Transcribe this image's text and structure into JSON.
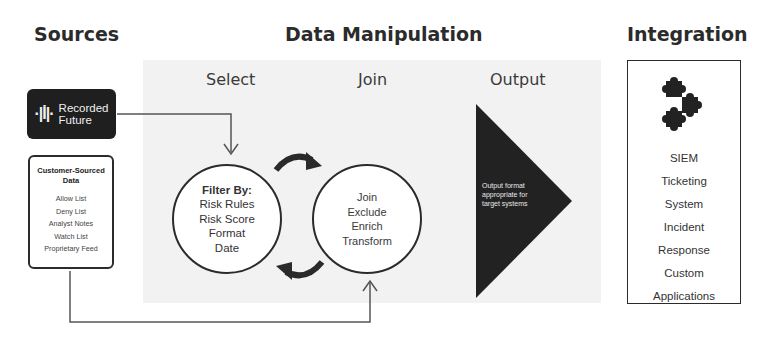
{
  "sections": {
    "sources": "Sources",
    "data_manipulation": "Data Manipulation",
    "integration": "Integration"
  },
  "columns": {
    "select": "Select",
    "join": "Join",
    "output": "Output"
  },
  "sources": {
    "recorded_future": {
      "logo_glyph": "·|İ|·",
      "line1": "Recorded",
      "line2": "Future"
    },
    "customer_sourced": {
      "title_line1": "Customer-Sourced",
      "title_line2": "Data",
      "items": [
        "Allow List",
        "Deny List",
        "Analyst Notes",
        "Watch List",
        "Proprietary Feed"
      ]
    }
  },
  "select_circle": {
    "header": "Filter By:",
    "items": [
      "Risk Rules",
      "Risk Score",
      "Format",
      "Date"
    ]
  },
  "join_circle": {
    "items": [
      "Join",
      "Exclude",
      "Enrich",
      "Transform"
    ]
  },
  "output": {
    "text": "Output format appropriate for target systems",
    "color": "#222222"
  },
  "integration": {
    "icon": "puzzle-pieces-icon",
    "items": [
      {
        "line1": "SIEM",
        "line2": ""
      },
      {
        "line1": "Ticketing",
        "line2": "System"
      },
      {
        "line1": "Incident",
        "line2": "Response"
      },
      {
        "line1": "Custom",
        "line2": "Applications"
      }
    ]
  }
}
